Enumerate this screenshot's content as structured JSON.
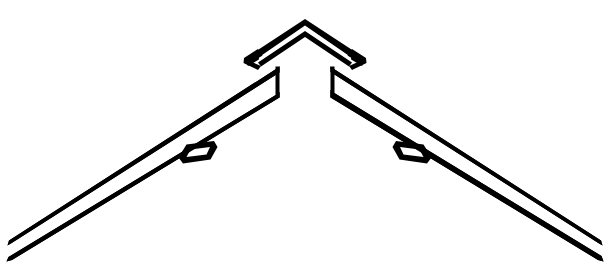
{
  "figure": {
    "description": "Black and white technical line drawing of a gable roof ridge: a chevron ridge cap above two tapering barge boards, each carrying a small mounting bracket.",
    "domain": "line-drawing",
    "canvas": {
      "width": 610,
      "height": 276
    },
    "colors": {
      "ink": "#000000",
      "paper": "#ffffff",
      "background": "#ffffff"
    },
    "parts": [
      {
        "id": "ridge-cap",
        "name": "ridge-cap",
        "label": "Ridge cap chevron",
        "apex": {
          "x": 305,
          "y": 21
        },
        "left_end": {
          "x": 244,
          "y": 60
        },
        "right_end": {
          "x": 362,
          "y": 60
        }
      },
      {
        "id": "left-barge-board",
        "name": "left-barge-board",
        "label": "Left barge board",
        "top_end": {
          "x": 279,
          "y": 67
        },
        "bottom_tip": {
          "x": 8,
          "y": 258
        }
      },
      {
        "id": "right-barge-board",
        "name": "right-barge-board",
        "label": "Right barge board",
        "top_end": {
          "x": 330,
          "y": 67
        },
        "bottom_tip": {
          "x": 602,
          "y": 258
        }
      },
      {
        "id": "left-bracket",
        "name": "left-bracket",
        "label": "Left mounting bracket",
        "center": {
          "x": 196,
          "y": 155
        }
      },
      {
        "id": "right-bracket",
        "name": "right-bracket",
        "label": "Right mounting bracket",
        "center": {
          "x": 412,
          "y": 155
        }
      }
    ],
    "geometry": {
      "ridge_cap_outer": "M 305 19 L 366 59 L 362 66 L 352 60 L 305 28 L 258 60 L 248 66 L 244 59 Z",
      "ridge_cap_inner": "M 305 33 L 348 62 L 345 66 L 305 40 L 265 66 L 262 62 Z",
      "left_board_outer": "M 279 67 L 279 97 L 10 260 L 6 255 Z",
      "left_board_inner": "M 275 76 L 275 90 L 22 244 L 18 240 Z",
      "right_board_outer": "M 330 67 L 330 97 L 599 260 L 603 255 Z",
      "right_board_inner": "M 334 76 L 334 90 L 587 244 L 591 240 Z",
      "left_bracket_outer": "M 181 160 L 188 146 L 213 143 L 210 156 Z",
      "left_bracket_inner": "M 186 157 L 191 149 L 208 147 L 206 153 Z",
      "right_bracket_outer": "M 429 160 L 422 146 L 397 143 L 400 156 Z",
      "right_bracket_inner": "M 424 157 L 419 149 L 402 147 L 404 153 Z"
    }
  }
}
